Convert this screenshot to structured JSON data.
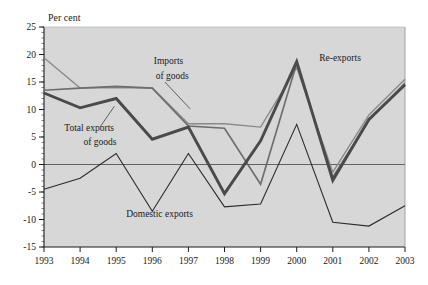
{
  "chart_data": {
    "type": "line",
    "title": "",
    "subtitle": "",
    "xlabel": "",
    "ylabel": "Per cent",
    "ylabel_position": "top-left",
    "categories": [
      "1993",
      "1994",
      "1995",
      "1996",
      "1997",
      "1998",
      "1999",
      "2000",
      "2001",
      "2002",
      "2003"
    ],
    "x": [
      1993,
      1994,
      1995,
      1996,
      1997,
      1998,
      1999,
      2000,
      2001,
      2002,
      2003
    ],
    "xlim": [
      1993,
      2003
    ],
    "ylim": [
      -15,
      25
    ],
    "ytick_values": [
      -15,
      -10,
      -5,
      0,
      5,
      10,
      15,
      20,
      25
    ],
    "ytick_labels": [
      "-15",
      "-10",
      "-5",
      "0",
      "5",
      "10",
      "15",
      "20",
      "25"
    ],
    "y_minor_tick_step": 1,
    "grid": false,
    "zero_line": true,
    "legend": "inline-annotations",
    "plot_background": "#d7d7d7",
    "page_background": "#ffffff",
    "series": [
      {
        "name": "Re-exports",
        "color": "#8a8a8a",
        "width": 1.4,
        "label_x": 2001.25,
        "label_y": 19.0,
        "values": [
          19.4,
          13.9,
          14.0,
          13.9,
          7.4,
          7.4,
          6.8,
          17.6,
          -1.4,
          9.0,
          15.5
        ]
      },
      {
        "name": "Imports of goods",
        "color": "#6e6e6e",
        "width": 1.7,
        "label_x": 1996.45,
        "label_y": 17.2,
        "values": [
          13.5,
          13.9,
          14.2,
          13.9,
          7.0,
          6.6,
          -3.6,
          18.4,
          -2.3,
          8.0,
          14.8
        ]
      },
      {
        "name": "Total exports of goods",
        "color": "#4a4a4a",
        "width": 2.9,
        "label_x": 1994.4,
        "label_y": 4.6,
        "values": [
          13.0,
          10.3,
          12.0,
          4.6,
          6.8,
          -5.3,
          4.3,
          18.7,
          -2.9,
          8.2,
          14.5
        ]
      },
      {
        "name": "Domestic exports",
        "color": "#2b2b2b",
        "width": 1.1,
        "label_x": 1996.35,
        "label_y": -9.6,
        "values": [
          -4.5,
          -2.5,
          2.0,
          -8.5,
          2.0,
          -7.7,
          -7.2,
          7.3,
          -10.5,
          -11.2,
          -7.5
        ]
      }
    ],
    "annotations": [
      {
        "text": "Per cent",
        "x": 1993.0,
        "y": 26.2
      },
      {
        "text": "Imports",
        "x": 1996.45,
        "y": 18.2
      },
      {
        "text": "of goods",
        "x": 1996.55,
        "y": 15.6
      },
      {
        "text": "Total exports",
        "x": 1994.25,
        "y": 6.1
      },
      {
        "text": "of goods",
        "x": 1994.55,
        "y": 3.5
      },
      {
        "text": "Domestic exports",
        "x": 1996.2,
        "y": -9.6
      },
      {
        "text": "Re-exports",
        "x": 2001.2,
        "y": 18.9
      }
    ],
    "leader_lines": [
      {
        "from_x": 1996.35,
        "from_y": 15.0,
        "to_x": 1997.05,
        "to_y": 10.1
      },
      {
        "from_x": 1994.55,
        "from_y": 6.8,
        "to_x": 1994.95,
        "to_y": 10.6
      }
    ]
  },
  "axis": {
    "ylabel_text": "Per cent",
    "ytick_labels": [
      "25",
      "20",
      "15",
      "10",
      "5",
      "0",
      "-5",
      "-10",
      "-15"
    ],
    "xtick_labels": [
      "1993",
      "1994",
      "1995",
      "1996",
      "1997",
      "1998",
      "1999",
      "2000",
      "2001",
      "2002",
      "2003"
    ]
  },
  "series_labels": {
    "re_exports": "Re-exports",
    "imports_line1": "Imports",
    "imports_line2": "of goods",
    "total_exports_line1": "Total exports",
    "total_exports_line2": "of goods",
    "domestic_exports": "Domestic exports"
  }
}
